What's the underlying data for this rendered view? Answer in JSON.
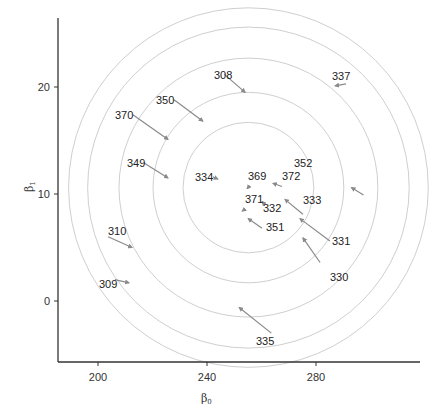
{
  "chart_data": {
    "type": "scatter",
    "subtype": "arrow-plot with concentric contour circles",
    "title": "",
    "xlabel": "β₀",
    "ylabel": "β₁",
    "xlim": [
      186,
      319
    ],
    "ylim": [
      -5.8,
      26.4
    ],
    "xticks": [
      200,
      240,
      280
    ],
    "yticks": [
      0,
      10,
      20
    ],
    "grid": false,
    "legend": null,
    "contours": {
      "center": [
        255.2,
        10.6
      ],
      "radii_x": [
        24,
        35,
        47.5,
        59,
        66
      ],
      "radii_y": [
        6.1,
        8.9,
        12.1,
        15.0,
        16.8
      ],
      "color": "#cfcfcf"
    },
    "arrows": [
      {
        "label": "308",
        "from": [
          246.3,
          21.2
        ],
        "to": [
          254.0,
          19.5
        ]
      },
      {
        "label": "337",
        "from": [
          291.0,
          20.3
        ],
        "to": [
          287.0,
          20.1
        ]
      },
      {
        "label": "350",
        "from": [
          227.9,
          18.8
        ],
        "to": [
          238.5,
          16.8
        ]
      },
      {
        "label": "370",
        "from": [
          212.8,
          17.4
        ],
        "to": [
          225.7,
          15.1
        ]
      },
      {
        "label": "349",
        "from": [
          216.9,
          12.9
        ],
        "to": [
          225.7,
          11.5
        ]
      },
      {
        "label": "334",
        "from": [
          242.2,
          11.6
        ],
        "to": [
          244.0,
          11.4
        ]
      },
      {
        "label": "352",
        "from": [
          297.4,
          9.9
        ],
        "to": [
          293.0,
          10.6
        ]
      },
      {
        "label": "369",
        "from": [
          255.4,
          10.7
        ],
        "to": [
          254.7,
          10.5
        ]
      },
      {
        "label": "372",
        "from": [
          267.5,
          10.7
        ],
        "to": [
          264.2,
          11.0
        ]
      },
      {
        "label": "371",
        "from": [
          254.0,
          8.6
        ],
        "to": [
          252.9,
          8.4
        ]
      },
      {
        "label": "332",
        "from": [
          261.3,
          9.0
        ],
        "to": [
          260.2,
          9.3
        ]
      },
      {
        "label": "333",
        "from": [
          275.2,
          8.1
        ],
        "to": [
          268.6,
          9.5
        ]
      },
      {
        "label": "351",
        "from": [
          260.2,
          6.8
        ],
        "to": [
          255.1,
          7.7
        ]
      },
      {
        "label": "331",
        "from": [
          285.1,
          5.6
        ],
        "to": [
          274.1,
          7.7
        ]
      },
      {
        "label": "330",
        "from": [
          281.5,
          3.6
        ],
        "to": [
          275.2,
          5.9
        ]
      },
      {
        "label": "310",
        "from": [
          203.7,
          6.0
        ],
        "to": [
          212.5,
          5.0
        ]
      },
      {
        "label": "309",
        "from": [
          206.2,
          2.0
        ],
        "to": [
          211.4,
          1.7
        ]
      },
      {
        "label": "335",
        "from": [
          263.6,
          -3.0
        ],
        "to": [
          251.8,
          -0.6
        ]
      }
    ]
  },
  "axes": {
    "x_title": "β",
    "x_title_sub": "0",
    "y_title": "β",
    "y_title_sub": "1",
    "x_tick_labels": [
      "200",
      "240",
      "280"
    ],
    "y_tick_labels": [
      "0",
      "10",
      "20"
    ]
  },
  "colors": {
    "axis": "#333333",
    "arrow": "#8a8a8a",
    "contour": "#cfcfcf",
    "text": "#222222"
  },
  "labels": [
    {
      "text": "308",
      "x": 214,
      "y": 79
    },
    {
      "text": "337",
      "x": 332,
      "y": 80
    },
    {
      "text": "350",
      "x": 156,
      "y": 104
    },
    {
      "text": "370",
      "x": 115,
      "y": 119
    },
    {
      "text": "349",
      "x": 127,
      "y": 167
    },
    {
      "text": "334",
      "x": 195,
      "y": 181
    },
    {
      "text": "352",
      "x": 294,
      "y": 167
    },
    {
      "text": "369",
      "x": 248,
      "y": 180
    },
    {
      "text": "372",
      "x": 282,
      "y": 180
    },
    {
      "text": "371",
      "x": 245,
      "y": 203
    },
    {
      "text": "332",
      "x": 263,
      "y": 212
    },
    {
      "text": "333",
      "x": 303,
      "y": 204
    },
    {
      "text": "351",
      "x": 266,
      "y": 231
    },
    {
      "text": "331",
      "x": 332,
      "y": 245
    },
    {
      "text": "330",
      "x": 330,
      "y": 281
    },
    {
      "text": "310",
      "x": 108,
      "y": 235
    },
    {
      "text": "309",
      "x": 99,
      "y": 288
    },
    {
      "text": "335",
      "x": 256,
      "y": 345
    }
  ]
}
